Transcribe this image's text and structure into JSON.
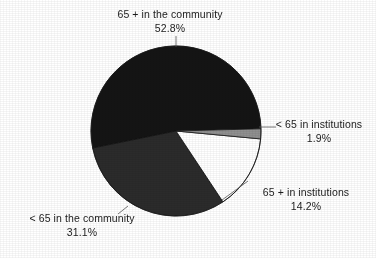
{
  "chart_data": {
    "type": "pie",
    "title": "",
    "subtitle": "",
    "legend_position": "callout-labels",
    "grid": false,
    "center": {
      "x": 176,
      "y": 131
    },
    "radius": 85,
    "start_angle_deg": -1.5,
    "direction": "clockwise",
    "total_percent": "100.0",
    "categories": [
      "< 65 in institutions",
      "65 + in institutions",
      "< 65 in the community",
      "65 + in the community"
    ],
    "values": [
      1.9,
      14.2,
      31.1,
      52.8
    ],
    "slices": [
      {
        "label": "< 65 in institutions",
        "percent_text": "1.9%",
        "value": 1.9,
        "color": "#8f8f8f",
        "stroke": "#1a1a1a"
      },
      {
        "label": "65 + in institutions",
        "percent_text": "14.2%",
        "value": 14.2,
        "color": "#ffffff",
        "stroke": "#1a1a1a"
      },
      {
        "label": "< 65 in the community",
        "percent_text": "31.1%",
        "value": 31.1,
        "color": "#2b2b2b",
        "stroke": "#101010"
      },
      {
        "label": "65 + in the community",
        "percent_text": "52.8%",
        "value": 52.8,
        "color": "#141414",
        "stroke": "#101010"
      }
    ],
    "xlabel": "",
    "ylabel": ""
  },
  "labels": {
    "top": {
      "name": "65 + in the community",
      "percent": "52.8%"
    },
    "right": {
      "name": "< 65 in institutions",
      "percent": "1.9%"
    },
    "lower_right": {
      "name": "65 + in institutions",
      "percent": "14.2%"
    },
    "lower_left": {
      "name": "< 65 in the community",
      "percent": "31.1%"
    }
  }
}
